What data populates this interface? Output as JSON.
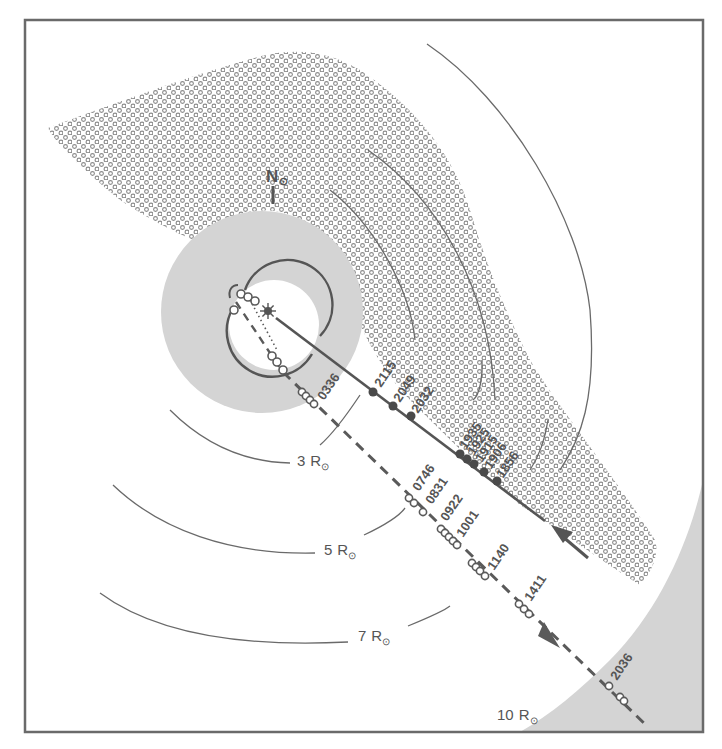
{
  "diagram": {
    "colors": {
      "frame": "#6a6a6a",
      "ink": "#5a5a5a",
      "occulter_gray": "#d4d4d4",
      "dot": "#8a8a8a",
      "background": "#ffffff"
    },
    "north_label": "N",
    "north_symbol": "⊙",
    "radius_labels": [
      {
        "value": "3",
        "unit": "R",
        "symbol": "⊙"
      },
      {
        "value": "5",
        "unit": "R",
        "symbol": "⊙"
      },
      {
        "value": "7",
        "unit": "R",
        "symbol": "⊙"
      },
      {
        "value": "10",
        "unit": "R",
        "symbol": "⊙"
      }
    ],
    "inbound_track": {
      "style": "solid line, filled dots",
      "direction": "toward sun",
      "times": [
        "2115",
        "2049",
        "2032",
        "1935",
        "1925",
        "1915",
        "1906",
        "1856"
      ]
    },
    "outbound_track": {
      "style": "dashed line, open circles",
      "direction": "away from sun",
      "times": [
        "0336",
        "0746",
        "0831",
        "0922",
        "1001",
        "1140",
        "1411",
        "2036"
      ]
    }
  }
}
